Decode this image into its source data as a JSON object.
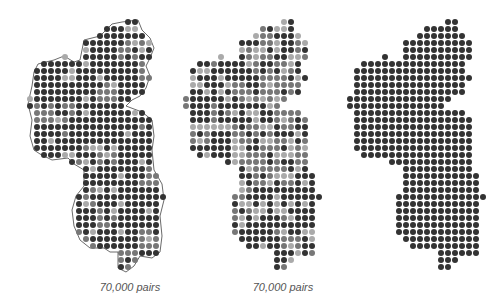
{
  "figure": {
    "background": "#ffffff",
    "dot_colors": {
      "dark": "#333333",
      "medium": "#777777",
      "light": "#aaaaaa"
    },
    "panels": [
      {
        "id": "map-1",
        "caption": "70,000 pairs",
        "x": 14,
        "caption_x": 130,
        "gray_fraction": 0.18,
        "outline": true
      },
      {
        "id": "map-2",
        "caption": "70,000 pairs",
        "x": 170,
        "caption_x": 283,
        "gray_fraction": 0.45,
        "outline": false
      },
      {
        "id": "map-3",
        "caption": "",
        "x": 334,
        "caption_x": 0,
        "gray_fraction": 0.0,
        "outline": false
      }
    ]
  }
}
